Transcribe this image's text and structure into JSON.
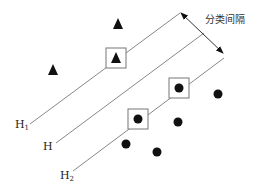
{
  "diagram": {
    "margin_label": "分类间隔",
    "hyperplanes": [
      {
        "id": "H1",
        "label": "H",
        "subscript": "1",
        "x1": 30,
        "y1": 124,
        "x2": 180,
        "y2": 13
      },
      {
        "id": "H",
        "label": "H",
        "subscript": "",
        "x1": 56,
        "y1": 143,
        "x2": 204,
        "y2": 33
      },
      {
        "id": "H2",
        "label": "H",
        "subscript": "2",
        "x1": 73,
        "y1": 171,
        "x2": 224,
        "y2": 58
      }
    ],
    "margin_arrow": {
      "x1": 181,
      "y1": 13,
      "x2": 223,
      "y2": 53
    },
    "triangles": [
      {
        "x": 118,
        "y": 24,
        "support_vector": false
      },
      {
        "x": 53,
        "y": 70,
        "support_vector": false
      },
      {
        "x": 116,
        "y": 58,
        "support_vector": true
      }
    ],
    "circles": [
      {
        "x": 179,
        "y": 88,
        "support_vector": true
      },
      {
        "x": 218,
        "y": 94,
        "support_vector": false
      },
      {
        "x": 138,
        "y": 119,
        "support_vector": true
      },
      {
        "x": 178,
        "y": 122,
        "support_vector": false
      },
      {
        "x": 126,
        "y": 144,
        "support_vector": false
      },
      {
        "x": 157,
        "y": 152,
        "support_vector": false
      }
    ],
    "colors": {
      "line": "#888888",
      "marker": "#111111",
      "box": "#777777"
    }
  }
}
